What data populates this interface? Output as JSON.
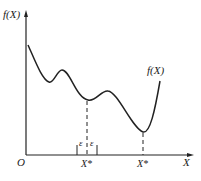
{
  "diagram": {
    "y_axis_label": "f(X)",
    "x_axis_label": "X",
    "origin_label": "O",
    "curve_label": "f(X)",
    "local_min_label": "X*",
    "global_min_label": "X*",
    "epsilon_left": "ε",
    "epsilon_right": "ε",
    "colors": {
      "line": "#222222",
      "background": "#ffffff"
    },
    "curve_points": [
      [
        28,
        45
      ],
      [
        49,
        82
      ],
      [
        62,
        70
      ],
      [
        88,
        100
      ],
      [
        108,
        91
      ],
      [
        143,
        132
      ],
      [
        160,
        81
      ]
    ]
  }
}
